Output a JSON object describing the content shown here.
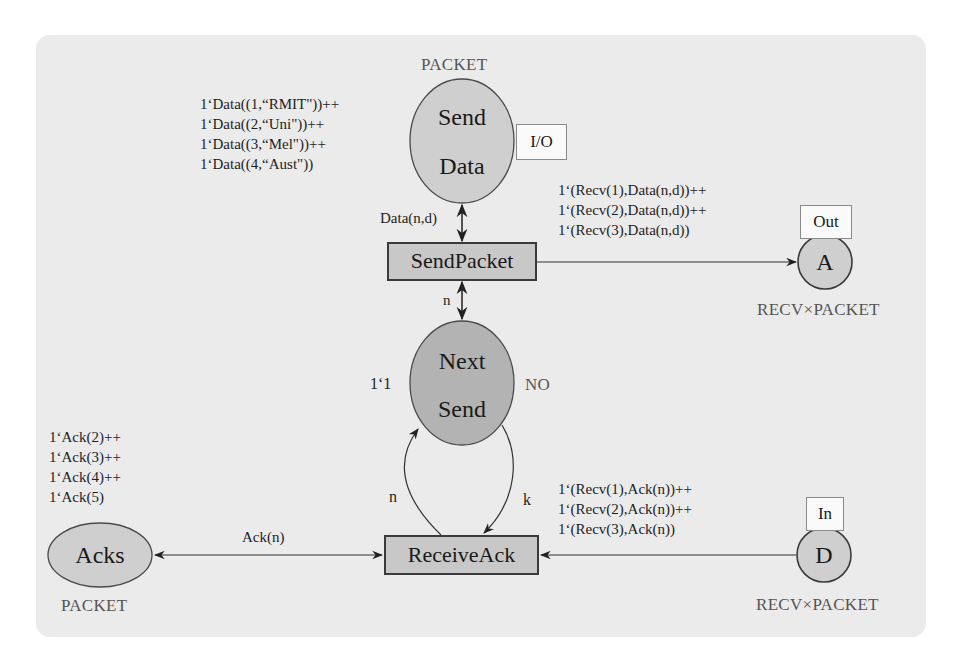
{
  "diagram": {
    "type": "coloured-petri-net",
    "places": {
      "send_data": {
        "label_line1": "Send",
        "label_line2": "Data",
        "colour_set": "PACKET",
        "port_tag": "I/O",
        "initial_marking": [
          "1‘Data((1,“RMIT\"))++",
          "1‘Data((2,“Uni\"))++",
          "1‘Data((3,“Mel\"))++",
          "1‘Data((4,“Aust\"))"
        ],
        "fill": "#cfcfcf"
      },
      "next_send": {
        "label_line1": "Next",
        "label_line2": "Send",
        "colour_set": "NO",
        "initial_marking": "1‘1",
        "fill": "#b3b3b3"
      },
      "acks": {
        "label": "Acks",
        "colour_set": "PACKET",
        "initial_marking": [
          "1‘Ack(2)++",
          "1‘Ack(3)++",
          "1‘Ack(4)++",
          "1‘Ack(5)"
        ],
        "fill": "#cfcfcf"
      },
      "a": {
        "label": "A",
        "colour_set": "RECV×PACKET",
        "port_tag": "Out",
        "fill": "#cfcfcf"
      },
      "d": {
        "label": "D",
        "colour_set": "RECV×PACKET",
        "port_tag": "In",
        "fill": "#cfcfcf"
      }
    },
    "transitions": {
      "send_packet": {
        "label": "SendPacket",
        "fill": "#c8c8c8"
      },
      "receive_ack": {
        "label": "ReceiveAck",
        "fill": "#c8c8c8"
      }
    },
    "arcs": {
      "senddata_sendpacket": "Data(n,d)",
      "nextsend_sendpacket": "n",
      "sendpacket_a": [
        "1‘(Recv(1),Data(n,d))++",
        "1‘(Recv(2),Data(n,d))++",
        "1‘(Recv(3),Data(n,d))"
      ],
      "receiveack_nextsend": "n",
      "nextsend_receiveack": "k",
      "d_receiveack": [
        "1‘(Recv(1),Ack(n))++",
        "1‘(Recv(2),Ack(n))++",
        "1‘(Recv(3),Ack(n))"
      ],
      "acks_receiveack": "Ack(n)"
    },
    "colors": {
      "background": "#ebebeb",
      "stroke": "#3a3a3a",
      "type_text": "#555555"
    }
  }
}
